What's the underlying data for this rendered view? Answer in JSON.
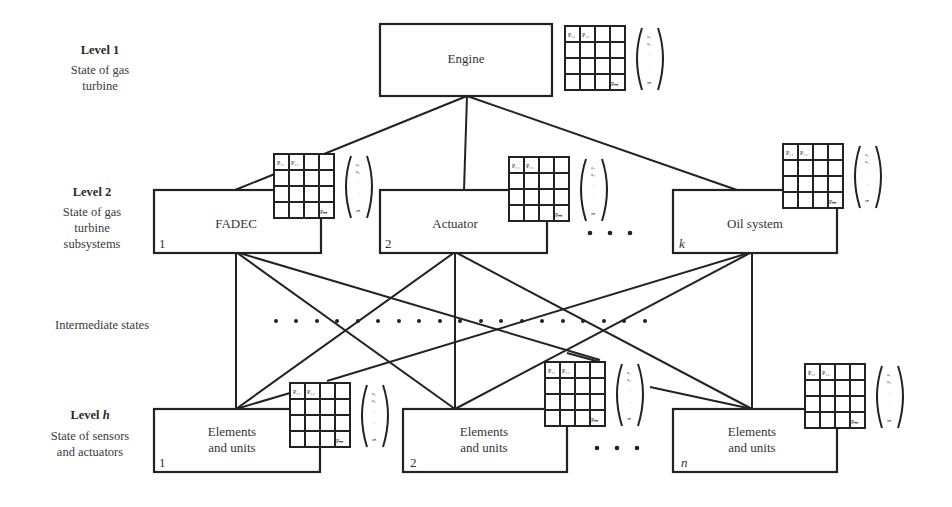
{
  "levels": [
    {
      "title": "Level 1",
      "title_italic_suffix": "",
      "desc": [
        "State of gas",
        "turbine"
      ]
    },
    {
      "title": "Level 2",
      "title_italic_suffix": "",
      "desc": [
        "State of gas",
        "turbine",
        "subsystems"
      ]
    },
    {
      "title": "Intermediate states"
    },
    {
      "title": "Level ",
      "title_italic_suffix": "h",
      "desc": [
        "State of sensors",
        "and actuators"
      ]
    }
  ],
  "nodes": {
    "engine": {
      "label": "Engine"
    },
    "level2": [
      {
        "label": "FADEC",
        "index": "1"
      },
      {
        "label": "Actuator",
        "index": "2"
      },
      {
        "label": "Oil system",
        "index": "k"
      }
    ],
    "levelh": [
      {
        "label": [
          "Elements",
          "and units"
        ],
        "index": "1"
      },
      {
        "label": [
          "Elements",
          "and units"
        ],
        "index": "2"
      },
      {
        "label": [
          "Elements",
          "and units"
        ],
        "index": "n"
      }
    ]
  },
  "matrix": {
    "cells": {
      "p11": "P11",
      "p12": "P12",
      "pnn": "Pnn"
    },
    "vector": [
      "a1",
      "a2",
      "·",
      "·",
      "an"
    ]
  },
  "ellipsis": "• • •"
}
